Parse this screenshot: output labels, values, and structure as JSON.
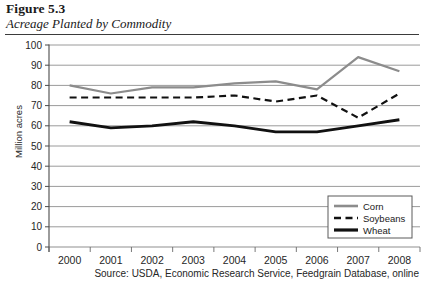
{
  "figure": {
    "number": "Figure 5.3",
    "title": "Acreage Planted by Commodity",
    "source": "Source: USDA, Economic Research Service, Feedgrain Database, online"
  },
  "chart_data": {
    "type": "line",
    "title": "Acreage Planted by Commodity",
    "xlabel": "",
    "ylabel": "Million acres",
    "categories": [
      "2000",
      "2001",
      "2002",
      "2003",
      "2004",
      "2005",
      "2006",
      "2007",
      "2008"
    ],
    "ylim": [
      0,
      100
    ],
    "ytick_step": 10,
    "yticks": [
      "0",
      "10",
      "20",
      "30",
      "40",
      "50",
      "60",
      "70",
      "80",
      "90",
      "100"
    ],
    "grid": "horizontal",
    "legend_position": "bottom-right",
    "series": [
      {
        "name": "Corn",
        "color": "#8c8c8c",
        "style": "solid",
        "width": 2.2,
        "values": [
          80,
          76,
          79,
          79,
          81,
          82,
          78,
          94,
          87
        ]
      },
      {
        "name": "Soybeans",
        "color": "#111111",
        "style": "dashed",
        "width": 2.2,
        "values": [
          74,
          74,
          74,
          74,
          75,
          72,
          75,
          64,
          76
        ]
      },
      {
        "name": "Wheat",
        "color": "#111111",
        "style": "solid",
        "width": 2.8,
        "values": [
          62,
          59,
          60,
          62,
          60,
          57,
          57,
          60,
          63
        ]
      }
    ]
  },
  "legend": {
    "items": [
      {
        "label": "Corn"
      },
      {
        "label": "Soybeans"
      },
      {
        "label": "Wheat"
      }
    ]
  }
}
